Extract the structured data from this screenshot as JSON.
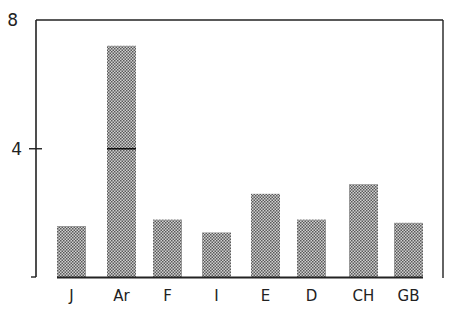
{
  "chart_data": {
    "type": "bar",
    "title": "",
    "xlabel": "",
    "ylabel": "",
    "categories": [
      "J",
      "Ar",
      "F",
      "I",
      "E",
      "D",
      "CH",
      "GB"
    ],
    "values": [
      1.6,
      7.2,
      1.8,
      1.4,
      2.6,
      1.8,
      2.9,
      1.7
    ],
    "ylim": [
      0,
      8
    ],
    "yticks": [
      0,
      4,
      8
    ],
    "ytick_labels": [
      "",
      "4",
      "8"
    ],
    "reference_marks": [
      {
        "category": "Ar",
        "value": 4
      }
    ],
    "grid": false,
    "legend": null,
    "bar_fill": "stippled grey"
  },
  "colors": {
    "bar": "#8a8a8a",
    "axis": "#222222",
    "background": "#ffffff"
  }
}
